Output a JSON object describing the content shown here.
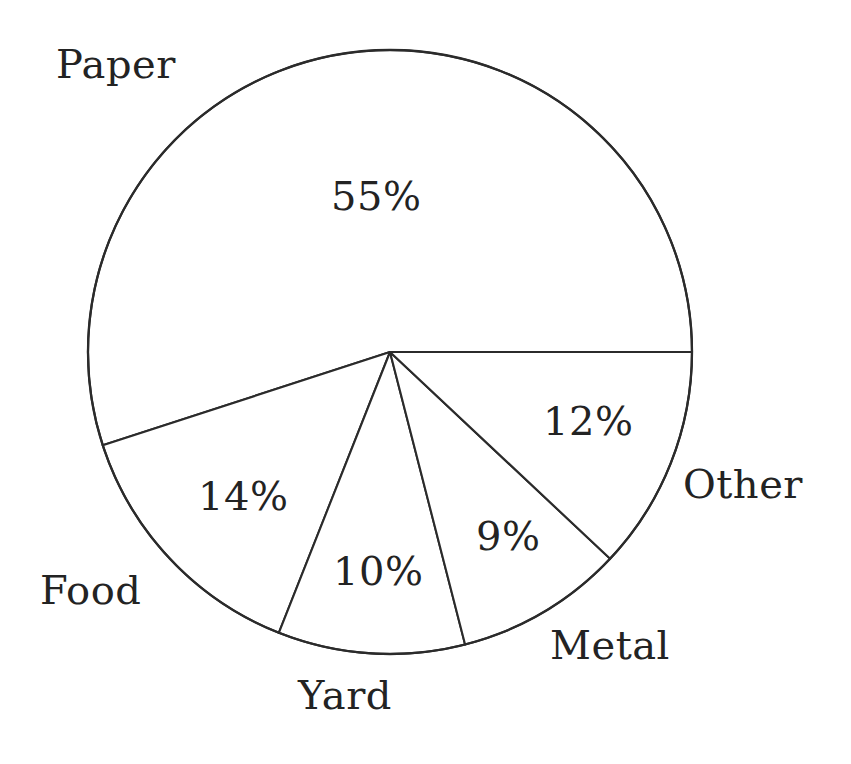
{
  "chart_data": {
    "type": "pie",
    "title": "",
    "subtitle": "",
    "xlabel": "",
    "ylabel": "",
    "legend": "none",
    "grid": false,
    "units": "percent",
    "total": 100,
    "start_angle_deg": 0,
    "direction": "counterclockwise",
    "categories": [
      "Paper",
      "Food",
      "Yard",
      "Metal",
      "Other"
    ],
    "values": [
      55,
      14,
      10,
      9,
      12
    ],
    "value_labels": [
      "55%",
      "14%",
      "10%",
      "9%",
      "12%"
    ],
    "slices": [
      {
        "name": "Paper",
        "value": 55,
        "value_label": "55%",
        "category_label": "Paper",
        "sweep_deg": 198.0,
        "start_deg": 0.0,
        "end_deg": 198.0,
        "fill": "#ffffff",
        "stroke": "#2b2b2b"
      },
      {
        "name": "Food",
        "value": 14,
        "value_label": "14%",
        "category_label": "Food",
        "sweep_deg": 50.4,
        "start_deg": 198.0,
        "end_deg": 248.4,
        "fill": "#ffffff",
        "stroke": "#2b2b2b"
      },
      {
        "name": "Yard",
        "value": 10,
        "value_label": "10%",
        "category_label": "Yard",
        "sweep_deg": 36.0,
        "start_deg": 248.4,
        "end_deg": 284.4,
        "fill": "#ffffff",
        "stroke": "#2b2b2b"
      },
      {
        "name": "Metal",
        "value": 9,
        "value_label": "9%",
        "category_label": "Metal",
        "sweep_deg": 32.4,
        "start_deg": 284.4,
        "end_deg": 316.8,
        "fill": "#ffffff",
        "stroke": "#2b2b2b"
      },
      {
        "name": "Other",
        "value": 12,
        "value_label": "12%",
        "category_label": "Other",
        "sweep_deg": 43.2,
        "start_deg": 316.8,
        "end_deg": 360.0,
        "fill": "#ffffff",
        "stroke": "#2b2b2b"
      }
    ],
    "colors": {
      "background": "#ffffff",
      "outline": "#2b2b2b",
      "text": "#232323"
    }
  },
  "geometry": {
    "center_x": 390,
    "center_y": 352,
    "radius": 302
  }
}
